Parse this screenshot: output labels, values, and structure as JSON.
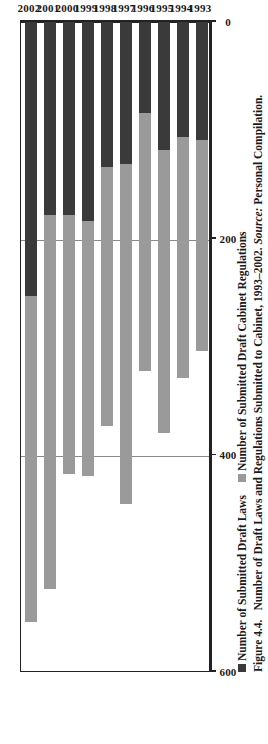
{
  "figure": {
    "number_label": "Figure 4.4.",
    "caption_main": "Number of Draft Laws and Regulations Submitted to Cabinet, 1993–2002.",
    "source_label": "Source:",
    "source_value": "Personal Compilation."
  },
  "legend": {
    "items": [
      {
        "label": "Number of Submitted Draft Laws",
        "color": "#3a3a3a",
        "swatch_name": "legend-swatch-draft-laws"
      },
      {
        "label": "Number of Submitted Draft Cabinet Regulations",
        "color": "#9a9a9a",
        "swatch_name": "legend-swatch-cabinet-regulations"
      }
    ]
  },
  "chart_data": {
    "type": "bar",
    "orientation": "vertical",
    "stacked": true,
    "title": "Number of Draft Laws and Regulations Submitted to Cabinet, 1993–2002",
    "xlabel": "",
    "ylabel": "",
    "categories": [
      "1993",
      "1994",
      "1995",
      "1996",
      "1997",
      "1998",
      "1999",
      "2000",
      "2001",
      "2002"
    ],
    "series": [
      {
        "name": "Number of Submitted Draft Laws",
        "color": "#3a3a3a",
        "values": [
          110,
          107,
          119,
          85,
          132,
          135,
          185,
          179,
          179,
          254
        ]
      },
      {
        "name": "Number of Submitted Draft Cabinet Regulations",
        "color": "#9a9a9a",
        "values": [
          195,
          223,
          261,
          238,
          314,
          239,
          235,
          239,
          345,
          301
        ]
      }
    ],
    "totals": [
      305,
      330,
      380,
      323,
      446,
      374,
      420,
      418,
      524,
      555
    ],
    "ylim": [
      0,
      600
    ],
    "yticks": [
      0,
      200,
      400,
      600
    ],
    "ytick_labels": [
      "0",
      "200",
      "400",
      "600"
    ],
    "grid": "value-axis-only"
  }
}
